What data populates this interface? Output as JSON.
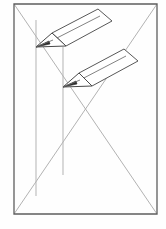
{
  "figure": {
    "caption": "",
    "canvas": {
      "width": 166,
      "height": 229,
      "background": "#fefefe"
    },
    "colors": {
      "frame_stroke": "#5e5e5e",
      "construction_stroke": "#a9a9a9",
      "guide_stroke": "#b3b3b3",
      "pencil_outline": "#585858",
      "pencil_fill": "#ffffff",
      "lead_fill": "#2c2c2c"
    },
    "frame": {
      "name": "picture-frame-rectangle",
      "x1": 14,
      "y1": 4,
      "x2": 157,
      "y2": 214,
      "points": "14,4 157,4 157,214 14,214"
    },
    "construction_lines": [
      {
        "name": "diagonal-top-left-to-bottom-right",
        "x1": 14,
        "y1": 4,
        "x2": 157,
        "y2": 214
      },
      {
        "name": "diagonal-top-right-to-bottom-left",
        "x1": 157,
        "y1": 4,
        "x2": 14,
        "y2": 214
      }
    ],
    "guide_verticals": [
      {
        "name": "guide-vertical-left",
        "x": 36,
        "y1": 20,
        "y2": 196
      },
      {
        "name": "guide-vertical-right",
        "x": 63,
        "y1": 47,
        "y2": 175
      }
    ],
    "pencils": [
      {
        "name": "pencil-upper-left",
        "tip_point": "36,47",
        "body": "52,33 98,9 112,21 66,46",
        "tip": "36,47 52,33 66,46",
        "ferrule_edge": "53,40 100,16",
        "lead": "36,47 49,41 50,44"
      },
      {
        "name": "pencil-lower-right",
        "tip_point": "63,87",
        "body": "79,73 124,49 138,61 92,86",
        "tip": "63,87 79,73 92,86",
        "ferrule_edge": "80,80 126,56",
        "lead": "63,87 76,81 77,84"
      }
    ]
  }
}
